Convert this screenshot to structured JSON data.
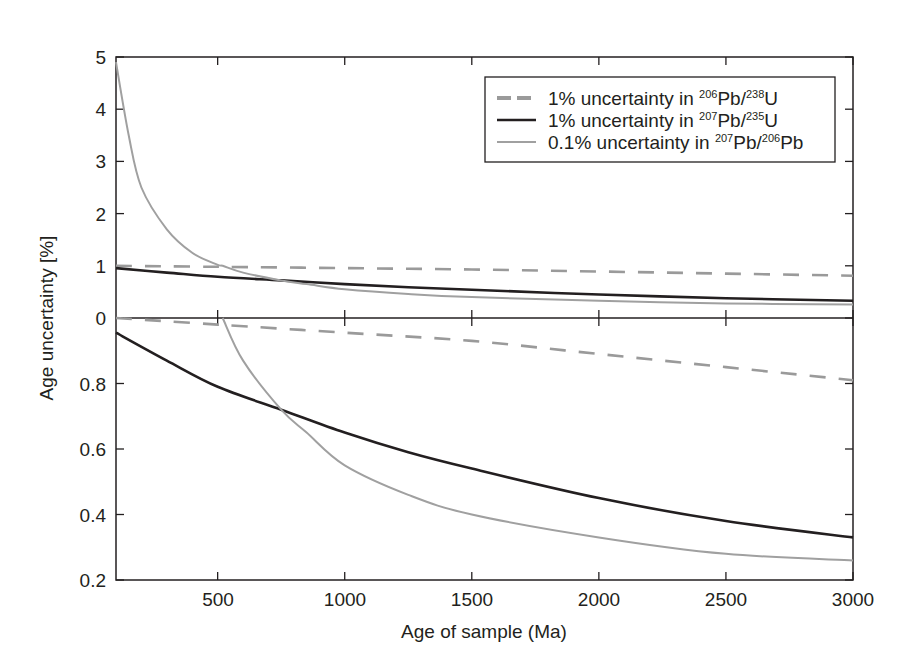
{
  "chart_data": {
    "type": "line",
    "title": "",
    "xlabel": "Age of sample (Ma)",
    "ylabel": "Age uncertainty [%]",
    "xlim": [
      100,
      3000
    ],
    "x_ticks": [
      500,
      1000,
      1500,
      2000,
      2500,
      3000
    ],
    "grid": false,
    "legend_position": "upper right (upper panel)",
    "panels": [
      {
        "name": "upper",
        "ylim": [
          0,
          5
        ],
        "y_ticks": [
          0,
          1,
          2,
          3,
          4,
          5
        ]
      },
      {
        "name": "lower",
        "ylim": [
          0.2,
          1.0
        ],
        "y_ticks": [
          0.2,
          0.4,
          0.6,
          0.8
        ]
      }
    ],
    "x": [
      100,
      150,
      200,
      300,
      400,
      500,
      520,
      600,
      750,
      850,
      1000,
      1250,
      1500,
      2000,
      2500,
      3000
    ],
    "series": [
      {
        "name": "1% uncertainty in 206Pb/238U",
        "style": "dashed",
        "color": "#9a9a9a",
        "points": [
          [
            100,
            1.0
          ],
          [
            500,
            0.98
          ],
          [
            1000,
            0.955
          ],
          [
            1500,
            0.93
          ],
          [
            2000,
            0.89
          ],
          [
            2500,
            0.85
          ],
          [
            3000,
            0.81
          ]
        ]
      },
      {
        "name": "1% uncertainty in 207Pb/235U",
        "style": "solid",
        "color": "#231f20",
        "points": [
          [
            100,
            0.955
          ],
          [
            300,
            0.87
          ],
          [
            500,
            0.79
          ],
          [
            750,
            0.72
          ],
          [
            1000,
            0.65
          ],
          [
            1250,
            0.59
          ],
          [
            1500,
            0.54
          ],
          [
            2000,
            0.45
          ],
          [
            2500,
            0.38
          ],
          [
            3000,
            0.33
          ]
        ]
      },
      {
        "name": "0.1% uncertainty in 207Pb/206Pb",
        "style": "solid-thin",
        "color": "#a0a0a0",
        "points": [
          [
            100,
            4.9
          ],
          [
            150,
            3.5
          ],
          [
            200,
            2.5
          ],
          [
            300,
            1.7
          ],
          [
            400,
            1.25
          ],
          [
            500,
            1.02
          ],
          [
            520,
            1.0
          ],
          [
            600,
            0.87
          ],
          [
            750,
            0.72
          ],
          [
            850,
            0.65
          ],
          [
            1000,
            0.55
          ],
          [
            1250,
            0.46
          ],
          [
            1500,
            0.4
          ],
          [
            2000,
            0.33
          ],
          [
            2500,
            0.28
          ],
          [
            3000,
            0.26
          ]
        ]
      }
    ]
  },
  "axes": {
    "xlabel": "Age of sample (Ma)",
    "ylabel": "Age uncertainty [%]",
    "x_tick_labels": [
      "500",
      "1000",
      "1500",
      "2000",
      "2500",
      "3000"
    ],
    "upper_y_tick_labels": [
      "5",
      "4",
      "3",
      "2",
      "1",
      "0"
    ],
    "lower_y_tick_labels": [
      "0.8",
      "0.6",
      "0.4",
      "0.2"
    ]
  },
  "legend": {
    "items": [
      {
        "prefix": "1% uncertainty in ",
        "sup1": "206",
        "mid": "Pb/",
        "sup2": "238",
        "suffix": "U"
      },
      {
        "prefix": "1% uncertainty in ",
        "sup1": "207",
        "mid": "Pb/",
        "sup2": "235",
        "suffix": "U"
      },
      {
        "prefix": "0.1% uncertainty in ",
        "sup1": "207",
        "mid": "Pb/",
        "sup2": "206",
        "suffix": "Pb"
      }
    ]
  },
  "colors": {
    "axis": "#231f20",
    "dashed_series": "#9a9a9a",
    "solid_black_series": "#231f20",
    "grey_series": "#a0a0a0"
  }
}
